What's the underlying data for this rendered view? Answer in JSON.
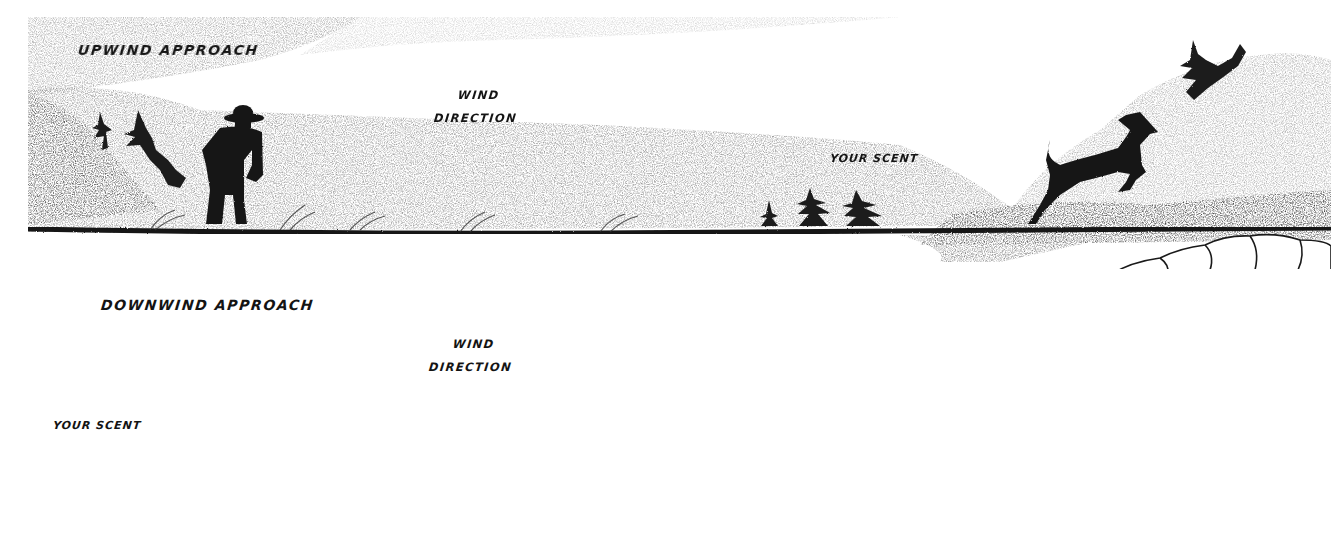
{
  "figure": {
    "colors": {
      "ink": "#141414",
      "shading": "#9a9a9a",
      "light_shading": "#d4d4d4",
      "background": "#ffffff"
    },
    "panels": [
      {
        "id": "upwind",
        "title": "UPWIND APPROACH",
        "wind_label_top": "WIND",
        "wind_label_bottom": "DIRECTION",
        "wind_arrow_direction": "right",
        "scent_label": "YOUR SCENT",
        "hunter": "standing-hunter-silhouette",
        "deer": "leaping-deer-silhouette",
        "deer_state": "fleeing"
      },
      {
        "id": "downwind",
        "title": "DOWNWIND APPROACH",
        "wind_label_top": "WIND",
        "wind_label_bottom": "DIRECTION",
        "wind_arrow_direction": "left",
        "scent_label": "YOUR SCENT",
        "hunter": "standing-hunter-silhouette",
        "deer": "grazing-deer-silhouette",
        "deer_state": "grazing"
      }
    ]
  }
}
